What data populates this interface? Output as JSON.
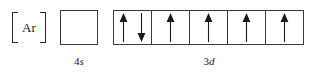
{
  "diagram": {
    "type": "orbital-box-diagram",
    "core": {
      "bracket_open": "[",
      "symbol": "Ar",
      "bracket_close": "]"
    },
    "subshells": [
      {
        "id": "4s",
        "principal_number": "4",
        "orbital_letter": "s",
        "caption": "4s",
        "box_count": 1,
        "boxes": [
          {
            "electrons": []
          }
        ]
      },
      {
        "id": "3d",
        "principal_number": "3",
        "orbital_letter": "d",
        "caption": "3d",
        "box_count": 5,
        "boxes": [
          {
            "electrons": [
              "up",
              "down"
            ]
          },
          {
            "electrons": [
              "up"
            ]
          },
          {
            "electrons": [
              "up"
            ]
          },
          {
            "electrons": [
              "up"
            ]
          },
          {
            "electrons": [
              "up"
            ]
          }
        ]
      }
    ],
    "colors": {
      "background": "#ffffff",
      "box_border": "#3a3a3a",
      "bracket": "#2b2b2b",
      "arrow": "#1a1a1a",
      "text": "#1a1a1a"
    }
  }
}
